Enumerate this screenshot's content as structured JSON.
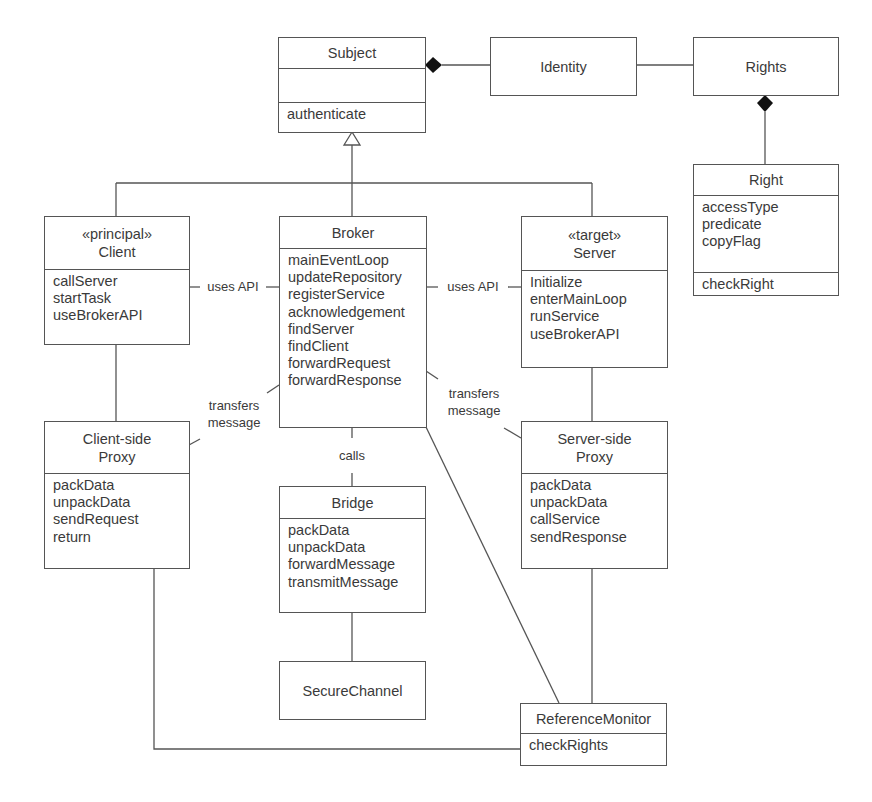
{
  "diagram": {
    "type": "UML class diagram",
    "classes": {
      "subject": {
        "name": "Subject",
        "attributes": [],
        "operations": [
          "authenticate"
        ]
      },
      "identity": {
        "name": "Identity"
      },
      "rights": {
        "name": "Rights"
      },
      "right": {
        "name": "Right",
        "attributes": [
          "accessType",
          "predicate",
          "copyFlag"
        ],
        "operations": [
          "checkRight"
        ]
      },
      "client": {
        "stereotype": "«principal»",
        "name": "Client",
        "operations": [
          "callServer",
          "startTask",
          "useBrokerAPI"
        ]
      },
      "broker": {
        "name": "Broker",
        "operations": [
          "mainEventLoop",
          "updateRepository",
          "registerService",
          "acknowledgement",
          "findServer",
          "findClient",
          "forwardRequest",
          "forwardResponse"
        ]
      },
      "server": {
        "stereotype": "«target»",
        "name": "Server",
        "operations": [
          "Initialize",
          "enterMainLoop",
          "runService",
          "useBrokerAPI"
        ]
      },
      "client_proxy": {
        "name_line1": "Client-side",
        "name_line2": "Proxy",
        "operations": [
          "packData",
          "unpackData",
          "sendRequest",
          "return"
        ]
      },
      "server_proxy": {
        "name_line1": "Server-side",
        "name_line2": "Proxy",
        "operations": [
          "packData",
          "unpackData",
          "callService",
          "sendResponse"
        ]
      },
      "bridge": {
        "name": "Bridge",
        "operations": [
          "packData",
          "unpackData",
          "forwardMessage",
          "transmitMessage"
        ]
      },
      "secure_channel": {
        "name": "SecureChannel"
      },
      "reference_monitor": {
        "name": "ReferenceMonitor",
        "operations": [
          "checkRights"
        ]
      }
    },
    "association_labels": {
      "client_broker": "uses API",
      "server_broker": "uses API",
      "client_proxy_broker_line1": "transfers",
      "client_proxy_broker_line2": "message",
      "server_proxy_broker_line1": "transfers",
      "server_proxy_broker_line2": "message",
      "broker_bridge": "calls"
    },
    "relationships": [
      {
        "from": "Subject",
        "to": "Identity",
        "kind": "composition"
      },
      {
        "from": "Identity",
        "to": "Rights",
        "kind": "association"
      },
      {
        "from": "Rights",
        "to": "Right",
        "kind": "composition"
      },
      {
        "from": "Client",
        "to": "Subject",
        "kind": "generalization"
      },
      {
        "from": "Broker",
        "to": "Subject",
        "kind": "generalization"
      },
      {
        "from": "Server",
        "to": "Subject",
        "kind": "generalization"
      },
      {
        "from": "Client",
        "to": "Broker",
        "kind": "association",
        "label": "uses API"
      },
      {
        "from": "Server",
        "to": "Broker",
        "kind": "association",
        "label": "uses API"
      },
      {
        "from": "Client-side Proxy",
        "to": "Broker",
        "kind": "association",
        "label": "transfers message"
      },
      {
        "from": "Server-side Proxy",
        "to": "Broker",
        "kind": "association",
        "label": "transfers message"
      },
      {
        "from": "Broker",
        "to": "Bridge",
        "kind": "association",
        "label": "calls"
      },
      {
        "from": "Bridge",
        "to": "SecureChannel",
        "kind": "association"
      },
      {
        "from": "Client",
        "to": "Client-side Proxy",
        "kind": "association"
      },
      {
        "from": "Server",
        "to": "Server-side Proxy",
        "kind": "association"
      },
      {
        "from": "Broker",
        "to": "ReferenceMonitor",
        "kind": "association"
      },
      {
        "from": "Server-side Proxy",
        "to": "ReferenceMonitor",
        "kind": "association"
      },
      {
        "from": "Client-side Proxy",
        "to": "ReferenceMonitor",
        "kind": "association"
      }
    ]
  }
}
